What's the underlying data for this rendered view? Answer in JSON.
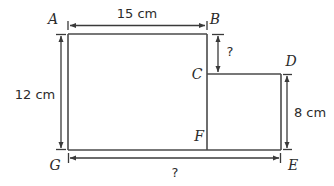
{
  "figure": {
    "type": "composite-rectilinear-polygon",
    "vertices": [
      {
        "id": "A",
        "label": "A",
        "role": "top-left-corner"
      },
      {
        "id": "B",
        "label": "B",
        "role": "top-right-corner-of-left-rectangle"
      },
      {
        "id": "C",
        "label": "C",
        "role": "inner-step-corner-top"
      },
      {
        "id": "D",
        "label": "D",
        "role": "top-right-corner-of-right-rectangle"
      },
      {
        "id": "E",
        "label": "E",
        "role": "bottom-right-corner"
      },
      {
        "id": "F",
        "label": "F",
        "role": "inner-step-corner-bottom"
      },
      {
        "id": "G",
        "label": "G",
        "role": "bottom-left-corner"
      }
    ],
    "dimensions": [
      {
        "id": "AB",
        "label": "15 cm",
        "value": 15,
        "unit": "cm",
        "orientation": "horizontal",
        "position": "top",
        "segment": "A to B",
        "known": true
      },
      {
        "id": "AG",
        "label": "12 cm",
        "value": 12,
        "unit": "cm",
        "orientation": "vertical",
        "position": "left",
        "segment": "A to G",
        "known": true
      },
      {
        "id": "BC",
        "label": "?",
        "value": null,
        "unit": "cm",
        "orientation": "vertical",
        "position": "inner-right",
        "segment": "B to C",
        "known": false
      },
      {
        "id": "DE",
        "label": "8 cm",
        "value": 8,
        "unit": "cm",
        "orientation": "vertical",
        "position": "right",
        "segment": "D to E",
        "known": true
      },
      {
        "id": "GE",
        "label": "?",
        "value": null,
        "unit": "cm",
        "orientation": "horizontal",
        "position": "bottom",
        "segment": "G to E",
        "known": false
      }
    ],
    "colors": {
      "background": "#ffffff",
      "shape_stroke": "#4a4a4a",
      "dimension_stroke": "#3a3a3a",
      "text": "#2b2b2b"
    }
  }
}
